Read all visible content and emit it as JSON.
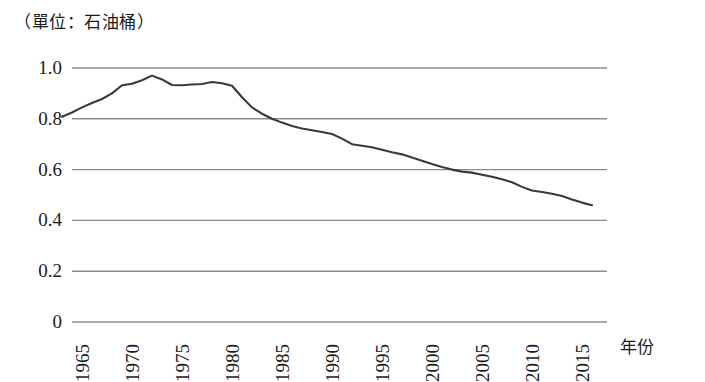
{
  "caption": "（單位：石油桶）",
  "axis": {
    "x_title": "年份",
    "y_ticks": [
      "1.0",
      "0.8",
      "0.6",
      "0.4",
      "0.2",
      "0"
    ],
    "x_ticks": [
      "1965",
      "1970",
      "1975",
      "1980",
      "1985",
      "1990",
      "1995",
      "2000",
      "2005",
      "2010",
      "2015"
    ]
  },
  "style": {
    "line_color": "#3a3a3a",
    "grid_color": "#8c8c8c",
    "background": "#ffffff"
  },
  "chart_data": {
    "type": "line",
    "title": "",
    "subtitle": "",
    "xlabel": "年份",
    "ylabel": "（單位：石油桶）",
    "xlim": [
      1963,
      2016.5
    ],
    "ylim": [
      0,
      1.06
    ],
    "grid": true,
    "gridlines_y": [
      0,
      0.2,
      0.4,
      0.6,
      0.8,
      1.0
    ],
    "legend": "none",
    "x_tick_labels": [
      "1965",
      "1970",
      "1975",
      "1980",
      "1985",
      "1990",
      "1995",
      "2000",
      "2005",
      "2010",
      "2015"
    ],
    "y_tick_labels": [
      "0",
      "0.2",
      "0.4",
      "0.6",
      "0.8",
      "1.0"
    ],
    "series": [
      {
        "name": "每單位產出之耗油量",
        "x": [
          1963,
          1964,
          1965,
          1966,
          1967,
          1968,
          1969,
          1970,
          1971,
          1972,
          1973,
          1974,
          1975,
          1976,
          1977,
          1978,
          1979,
          1980,
          1981,
          1982,
          1983,
          1984,
          1985,
          1986,
          1987,
          1988,
          1989,
          1990,
          1991,
          1992,
          1993,
          1994,
          1995,
          1996,
          1997,
          1998,
          1999,
          2000,
          2001,
          2002,
          2003,
          2004,
          2005,
          2006,
          2007,
          2008,
          2009,
          2010,
          2011,
          2012,
          2013,
          2014,
          2015,
          2016
        ],
        "y": [
          0.808,
          0.825,
          0.845,
          0.862,
          0.878,
          0.9,
          0.932,
          0.938,
          0.952,
          0.97,
          0.955,
          0.933,
          0.932,
          0.935,
          0.937,
          0.945,
          0.94,
          0.93,
          0.885,
          0.845,
          0.82,
          0.8,
          0.785,
          0.772,
          0.762,
          0.755,
          0.748,
          0.74,
          0.722,
          0.7,
          0.694,
          0.688,
          0.678,
          0.668,
          0.66,
          0.648,
          0.635,
          0.622,
          0.61,
          0.6,
          0.592,
          0.588,
          0.58,
          0.572,
          0.562,
          0.55,
          0.532,
          0.518,
          0.512,
          0.505,
          0.496,
          0.482,
          0.47,
          0.46
        ]
      }
    ],
    "annotations": [
      {
        "text": "peak",
        "x": 1972,
        "y": 0.97
      },
      {
        "text": "end",
        "x": 2016,
        "y": 0.437
      }
    ]
  },
  "plot_geometry": {
    "left": 72,
    "right": 607,
    "y_top": 68,
    "y_zero": 322,
    "y_per_unit": 254,
    "x_1965": 82,
    "x_per_year": 10
  }
}
